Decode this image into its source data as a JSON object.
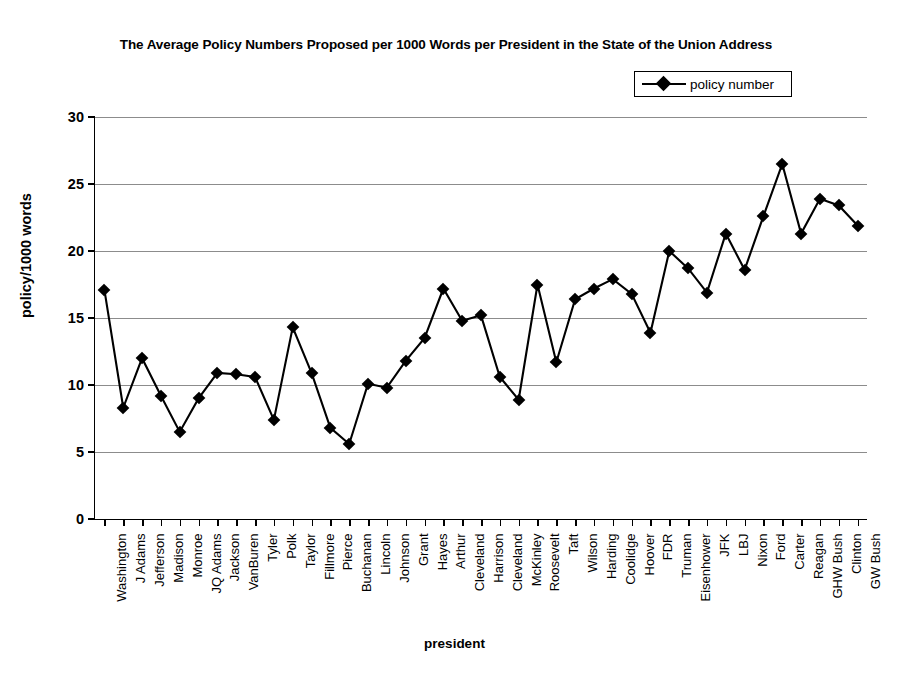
{
  "chart_data": {
    "type": "line",
    "title": "The Average Policy Numbers Proposed per 1000 Words per President in the State of the Union Address",
    "xlabel": "president",
    "ylabel": "policy/1000 words",
    "ylim": [
      0,
      30
    ],
    "yticks": [
      0,
      5,
      10,
      15,
      20,
      25,
      30
    ],
    "grid": "horizontal",
    "legend_position": "top-right",
    "legend": [
      "policy number"
    ],
    "marker": "diamond",
    "line_color": "#000000",
    "categories": [
      "Washington",
      "J Adams",
      "Jefferson",
      "Madison",
      "Monroe",
      "JQ Adams",
      "Jackson",
      "VanBuren",
      "Tyler",
      "Polk",
      "Taylor",
      "Fillmore",
      "Pierce",
      "Buchanan",
      "Lincoln",
      "Johnson",
      "Grant",
      "Hayes",
      "Arthur",
      "Cleveland",
      "Harrison",
      "Cleveland",
      "McKinley",
      "Roosevelt",
      "Taft",
      "Wilson",
      "Harding",
      "Coolidge",
      "Hoover",
      "FDR",
      "Truman",
      "Eisenhower",
      "JFK",
      "LBJ",
      "Nixon",
      "Ford",
      "Carter",
      "Reagan",
      "GHW Bush",
      "Clinton",
      "GW Bush"
    ],
    "series": [
      {
        "name": "policy number",
        "values": [
          17.1,
          8.3,
          12.0,
          9.2,
          6.5,
          9.0,
          10.9,
          10.8,
          10.6,
          7.4,
          14.3,
          10.9,
          6.8,
          5.6,
          10.1,
          9.8,
          11.8,
          13.5,
          17.2,
          14.8,
          15.2,
          10.6,
          8.9,
          17.5,
          11.7,
          16.4,
          17.2,
          17.9,
          16.8,
          13.9,
          20.0,
          18.7,
          16.9,
          21.3,
          18.6,
          22.6,
          26.5,
          21.3,
          23.9,
          23.4,
          21.9
        ]
      }
    ]
  },
  "axis": {
    "y_tick_labels": [
      "0",
      "5",
      "10",
      "15",
      "20",
      "25",
      "30"
    ]
  }
}
